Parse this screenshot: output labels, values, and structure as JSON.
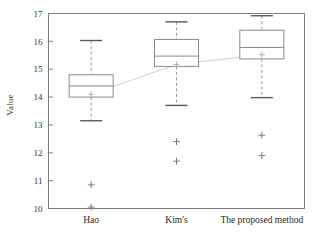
{
  "chart_data": {
    "type": "box",
    "title": "",
    "xlabel": "",
    "ylabel": "Value",
    "categories": [
      "Hao",
      "Kim's",
      "The proposed method"
    ],
    "ylim": [
      10,
      17
    ],
    "yticks": [
      10,
      11,
      12,
      13,
      14,
      15,
      16,
      17
    ],
    "ytick_labels": [
      "10",
      "11",
      "12",
      "13",
      "14",
      "15",
      "16",
      "17"
    ],
    "grid": false,
    "legend": "none",
    "colors": {
      "box_line": "#8a8a8a",
      "median_line": "#8a8a8a",
      "whisker_line": "#9a9a9a",
      "cap_line": "#5a5a5a",
      "outlier": "#7a7a7a",
      "mean_marker": "#a9a9a9",
      "mean_connector": "#c8c8c8",
      "frame": "#7d7d7d",
      "background": "#ffffff"
    },
    "boxes": [
      {
        "name": "Hao",
        "whisker_low": 13.15,
        "q1": 14.0,
        "median": 14.4,
        "q3": 14.8,
        "whisker_high": 16.03,
        "mean": 14.1,
        "outliers": [
          10.85,
          10.05
        ]
      },
      {
        "name": "Kim's",
        "whisker_low": 13.7,
        "q1": 15.1,
        "median": 15.47,
        "q3": 16.07,
        "whisker_high": 16.7,
        "mean": 15.17,
        "outliers": [
          12.4,
          11.7
        ]
      },
      {
        "name": "The proposed method",
        "whisker_low": 13.98,
        "q1": 15.37,
        "median": 15.78,
        "q3": 16.4,
        "whisker_high": 16.92,
        "mean": 15.52,
        "outliers": [
          12.63,
          11.9
        ]
      }
    ],
    "mean_connector_series": {
      "name": "mean-trend",
      "x": [
        "Hao",
        "Kim's",
        "The proposed method"
      ],
      "values": [
        14.1,
        15.17,
        15.52
      ]
    }
  }
}
